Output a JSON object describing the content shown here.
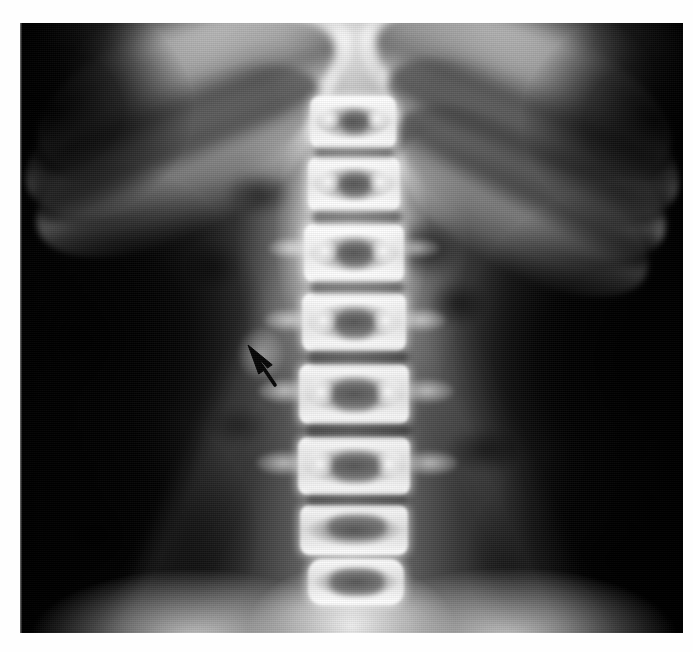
{
  "page": {
    "background_color": "#fefefe",
    "width": 693,
    "height": 652
  },
  "figure": {
    "type": "radiograph",
    "modality": "X-ray",
    "view": "anteroposterior",
    "region": "abdomen / lumbar spine",
    "colorspace": "grayscale",
    "caption_mark": "",
    "film": {
      "left": 20,
      "top": 23,
      "width": 663,
      "height": 610,
      "border_color": "#000000"
    }
  },
  "annotations": {
    "arrow": {
      "name": "pointer-arrow",
      "color": "#0a0a0a",
      "tip_x": 248,
      "tip_y": 345,
      "tail_x": 275,
      "tail_y": 385,
      "direction": "up-left",
      "points_at": "faint opacity in left renal region"
    }
  },
  "anatomy": {
    "vertebrae": [
      {
        "label": "T11",
        "cx": 355,
        "cy": 123,
        "w": 86,
        "h": 52
      },
      {
        "label": "T12",
        "cx": 356,
        "cy": 185,
        "w": 92,
        "h": 54
      },
      {
        "label": "L1",
        "cx": 357,
        "cy": 254,
        "w": 100,
        "h": 58
      },
      {
        "label": "L2",
        "cx": 357,
        "cy": 323,
        "w": 104,
        "h": 58
      },
      {
        "label": "L3",
        "cx": 357,
        "cy": 395,
        "w": 110,
        "h": 60
      },
      {
        "label": "L4",
        "cx": 357,
        "cy": 468,
        "w": 112,
        "h": 58
      },
      {
        "label": "L5",
        "cx": 357,
        "cy": 534,
        "w": 108,
        "h": 50
      }
    ],
    "structures": [
      "ribs",
      "diaphragm",
      "psoas margins",
      "bowel gas",
      "iliac wings",
      "sacrum"
    ]
  }
}
